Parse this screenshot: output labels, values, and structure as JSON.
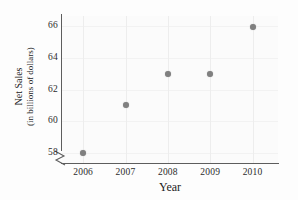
{
  "chart_data": {
    "type": "scatter",
    "title": "",
    "xlabel": "Year",
    "ylabel_line1": "Net Sales",
    "ylabel_line2": "(in billions of dollars)",
    "x": [
      2006,
      2007,
      2008,
      2009,
      2010
    ],
    "values": [
      58,
      61,
      63,
      63,
      65.9
    ],
    "series": [
      {
        "name": "Net Sales",
        "points": [
          {
            "x": 2006,
            "y": 58
          },
          {
            "x": 2007,
            "y": 61
          },
          {
            "x": 2008,
            "y": 63
          },
          {
            "x": 2009,
            "y": 63
          },
          {
            "x": 2010,
            "y": 65.9
          }
        ]
      }
    ],
    "xtick_labels": [
      "2006",
      "2007",
      "2008",
      "2009",
      "2010"
    ],
    "ytick_labels": [
      "58",
      "60",
      "62",
      "64",
      "66"
    ],
    "ytick_values": [
      58,
      60,
      62,
      64,
      66
    ],
    "xlim": [
      2005.5,
      2010.6
    ],
    "ylim": [
      57.4,
      66.6
    ],
    "grid": true,
    "grid_orientation": "vertical",
    "legend": false,
    "axis_break": {
      "axis": "y",
      "symbol": "zigzag",
      "below_value": 58
    },
    "marker_color": "#808080",
    "axis_color": "#5d5d5d",
    "grid_color": "#ededed",
    "background_color": "#fbfbfb"
  }
}
